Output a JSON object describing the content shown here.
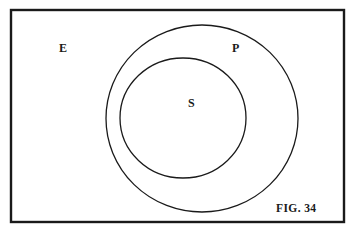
{
  "figure": {
    "caption": "FIG. 34",
    "type": "venn-euler-diagram",
    "stroke_color": "#1a1a1a",
    "background": "#ffffff"
  },
  "universe": {
    "label": "E",
    "rect": {
      "x": 11,
      "y": 10,
      "width": 333,
      "height": 212
    }
  },
  "sets": [
    {
      "label": "P",
      "role": "outer",
      "cx": 202,
      "cy": 118.5,
      "rx": 96,
      "ry": 93.5
    },
    {
      "label": "S",
      "role": "inner",
      "cx": 183,
      "cy": 118,
      "rx": 63,
      "ry": 60
    }
  ],
  "relation": "S is a subset of P, which is a subset of E"
}
